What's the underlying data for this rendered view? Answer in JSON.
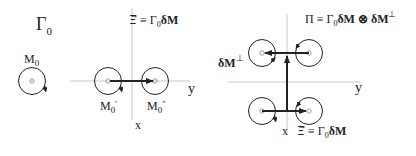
{
  "panel1": {
    "title": "Γ",
    "title_sub": "0",
    "circle_label": "M",
    "circle_label_sub": "0"
  },
  "panel2": {
    "equation_lhs": "Ξ⃗",
    "equation": " ≡ Γ",
    "equation_sub": "0",
    "equation_tail": "δM",
    "left_label": "M",
    "left_label_sub": "0",
    "left_label_prime": "'",
    "right_label": "M",
    "right_label_sub": "0",
    "right_label_prime": "''",
    "axis_y": "y",
    "axis_x": "x"
  },
  "panel3": {
    "top_equation_a": "Π ≡ Γ",
    "top_equation_sub": "0",
    "top_equation_b": "δM ⊗ δM",
    "top_equation_sup": "⊥",
    "side_label": "δM",
    "side_label_sup": "⊥",
    "axis_y": "y",
    "axis_x": "x",
    "bottom_equation_lhs": "Ξ⃗",
    "bottom_equation": " ≡ Γ",
    "bottom_equation_sub": "0",
    "bottom_equation_tail": "δM"
  },
  "colors": {
    "axis": "#c8c8c8",
    "stroke": "#222222",
    "dot": "#888888"
  }
}
